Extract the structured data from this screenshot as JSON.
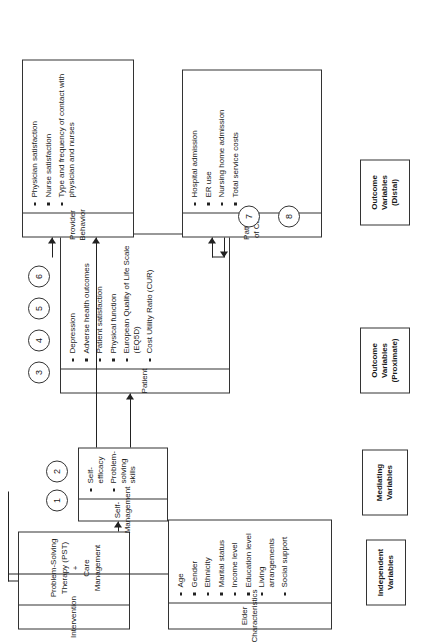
{
  "figure": {
    "orientation": "rotated-90-ccw",
    "type": "conceptual-framework-diagram"
  },
  "boxes": {
    "intervention": {
      "header": "Intervention",
      "lines": [
        "Problem-Solving",
        "Therapy (PST)",
        "+",
        "Care",
        "Management"
      ],
      "text": "Problem-Solving Therapy (PST) + Care Management",
      "circles": []
    },
    "elder": {
      "header": "Elder Characteristics",
      "header_lines": [
        "Elder",
        "Characteristics"
      ],
      "items": [
        "Age",
        "Gender",
        "Ethnicity",
        "Marital status",
        "Income level",
        "Education level",
        "Living arrangements",
        "Social support"
      ]
    },
    "self_management": {
      "header": "Self-Management",
      "items": [
        "Self-efficacy",
        "Problem-solving skills"
      ],
      "circles": [
        "1",
        "2"
      ]
    },
    "patient": {
      "header": "Patient",
      "items": [
        "Depression",
        "Adverse health outcomes",
        "Patient satisfaction",
        "Physical function",
        "European Quality of Life Scale (EQ5D)",
        "Cost Utility Ratio (CUR)"
      ],
      "circles": [
        "3",
        "4",
        "5",
        "6"
      ]
    },
    "provider": {
      "header": "Provider Behavior",
      "items": [
        "Physician satisfaction",
        "Nurse satisfaction",
        "Type and frequency of contact with physician and nurses"
      ],
      "circles": []
    },
    "patterns": {
      "header": "Patterns of Care",
      "items": [
        "Hospital admission",
        "ER use",
        "Nursing home admission",
        "Total service costs"
      ],
      "circles": [
        "7",
        "8"
      ]
    }
  },
  "column_labels": [
    {
      "id": "independent",
      "lines": [
        "Independent",
        "Variables"
      ]
    },
    {
      "id": "mediating",
      "lines": [
        "Mediating",
        "Variables"
      ]
    },
    {
      "id": "outcome-proximate",
      "lines": [
        "Outcome",
        "Variables",
        "(Proximate)"
      ]
    },
    {
      "id": "outcome-distal",
      "lines": [
        "Outcome",
        "Variables",
        "(Distal)"
      ]
    }
  ],
  "colors": {
    "stroke": "#333333",
    "background": "#ffffff",
    "text": "#1a1a1a"
  }
}
